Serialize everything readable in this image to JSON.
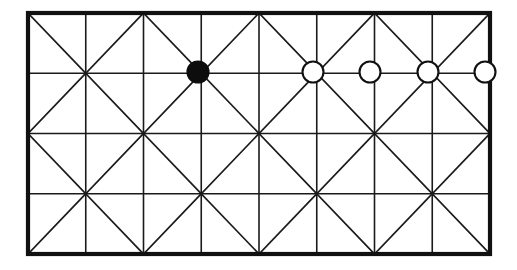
{
  "figure": {
    "background_color": "#ffffff",
    "line_color": "#1a1a1a",
    "border_color": "#111111"
  },
  "grid": {
    "origin_x": 28,
    "origin_y": 13,
    "width": 462,
    "height": 241,
    "columns": 8,
    "rows": 4,
    "cell_width": 57.75,
    "cell_height": 60.25,
    "border_stroke_width": 4.2,
    "interior_stroke_width": 1.6,
    "diagonal_stroke_width": 1.7,
    "diagonal_pattern": "checkerboard-alternating",
    "vertical_line_positions": [
      28,
      85.75,
      143.5,
      201.25,
      259,
      316.75,
      374.5,
      432.25,
      490
    ],
    "horizontal_line_positions": [
      13,
      73.25,
      133.5,
      193.75,
      254
    ]
  },
  "nodes": [
    {
      "name": "node-filled-1",
      "label": "filled vertex",
      "style": "filled",
      "fill_color": "#0d0d0d",
      "stroke_color": "#0d0d0d",
      "cx": 198,
      "cy": 72,
      "r": 11
    },
    {
      "name": "node-open-1",
      "label": "open vertex 1",
      "style": "open",
      "fill_color": "#ffffff",
      "stroke_color": "#111111",
      "cx": 313,
      "cy": 72,
      "r": 10.5
    },
    {
      "name": "node-open-2",
      "label": "open vertex 2",
      "style": "open",
      "fill_color": "#ffffff",
      "stroke_color": "#111111",
      "cx": 370,
      "cy": 72,
      "r": 10.5
    },
    {
      "name": "node-open-3",
      "label": "open vertex 3",
      "style": "open",
      "fill_color": "#ffffff",
      "stroke_color": "#111111",
      "cx": 428,
      "cy": 72,
      "r": 10.5
    },
    {
      "name": "node-open-4",
      "label": "open vertex 4",
      "style": "open",
      "fill_color": "#ffffff",
      "stroke_color": "#111111",
      "cx": 485,
      "cy": 72,
      "r": 10.5
    }
  ]
}
